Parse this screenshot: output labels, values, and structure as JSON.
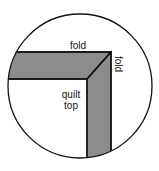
{
  "diagram": {
    "type": "quilt-binding-corner-illustration",
    "labels": {
      "top_fold": "fold",
      "side_fold": "fold",
      "quilt_top_line1": "quilt",
      "quilt_top_line2": "top"
    },
    "colors": {
      "background": "#ffffff",
      "outline": "#111111",
      "binding_fill": "#8c8c8c",
      "quilt_fill": "#ffffff"
    }
  }
}
